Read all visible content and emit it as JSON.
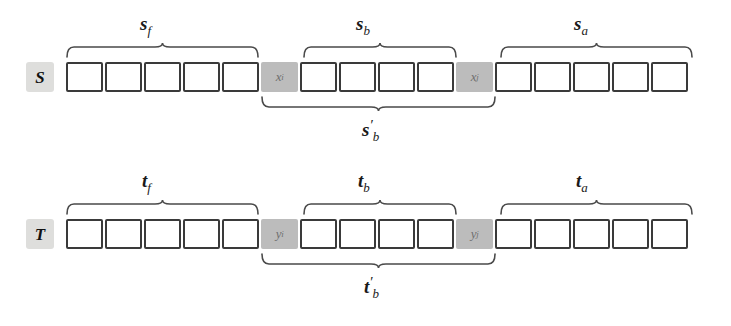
{
  "figure": {
    "background_color": "#ffffff",
    "cell_border_color": "#3a3a3a",
    "shaded_cell_color": "#bcbcbc",
    "badge_color": "#dededc",
    "brace_color": "#4a4a4a"
  },
  "rows": [
    {
      "name": "S",
      "cells": [
        {
          "type": "empty"
        },
        {
          "type": "empty"
        },
        {
          "type": "empty"
        },
        {
          "type": "empty"
        },
        {
          "type": "empty"
        },
        {
          "type": "shaded",
          "base": "x",
          "sub": "i"
        },
        {
          "type": "empty"
        },
        {
          "type": "empty"
        },
        {
          "type": "empty"
        },
        {
          "type": "empty"
        },
        {
          "type": "shaded",
          "base": "x",
          "sub": "j"
        },
        {
          "type": "empty"
        },
        {
          "type": "empty"
        },
        {
          "type": "empty"
        },
        {
          "type": "empty"
        },
        {
          "type": "empty"
        }
      ],
      "top_labels": [
        {
          "base": "s",
          "sub": "f",
          "prime": ""
        },
        {
          "base": "s",
          "sub": "b",
          "prime": ""
        },
        {
          "base": "s",
          "sub": "a",
          "prime": ""
        }
      ],
      "bottom_label": {
        "base": "s",
        "sub": "b",
        "prime": "′"
      }
    },
    {
      "name": "T",
      "cells": [
        {
          "type": "empty"
        },
        {
          "type": "empty"
        },
        {
          "type": "empty"
        },
        {
          "type": "empty"
        },
        {
          "type": "empty"
        },
        {
          "type": "shaded",
          "base": "y",
          "sub": "i"
        },
        {
          "type": "empty"
        },
        {
          "type": "empty"
        },
        {
          "type": "empty"
        },
        {
          "type": "empty"
        },
        {
          "type": "shaded",
          "base": "y",
          "sub": "j"
        },
        {
          "type": "empty"
        },
        {
          "type": "empty"
        },
        {
          "type": "empty"
        },
        {
          "type": "empty"
        },
        {
          "type": "empty"
        }
      ],
      "top_labels": [
        {
          "base": "t",
          "sub": "f",
          "prime": ""
        },
        {
          "base": "t",
          "sub": "b",
          "prime": ""
        },
        {
          "base": "t",
          "sub": "a",
          "prime": ""
        }
      ],
      "bottom_label": {
        "base": "t",
        "sub": "b",
        "prime": "′"
      }
    }
  ],
  "brace_spans": {
    "front": {
      "left": 66,
      "width": 193
    },
    "block": {
      "left": 303,
      "width": 154
    },
    "after": {
      "left": 500,
      "width": 193
    },
    "extended_block": {
      "left": 261,
      "width": 235
    }
  },
  "label_positions": {
    "front": 152,
    "block": 366,
    "after": 582,
    "extended": 366
  }
}
